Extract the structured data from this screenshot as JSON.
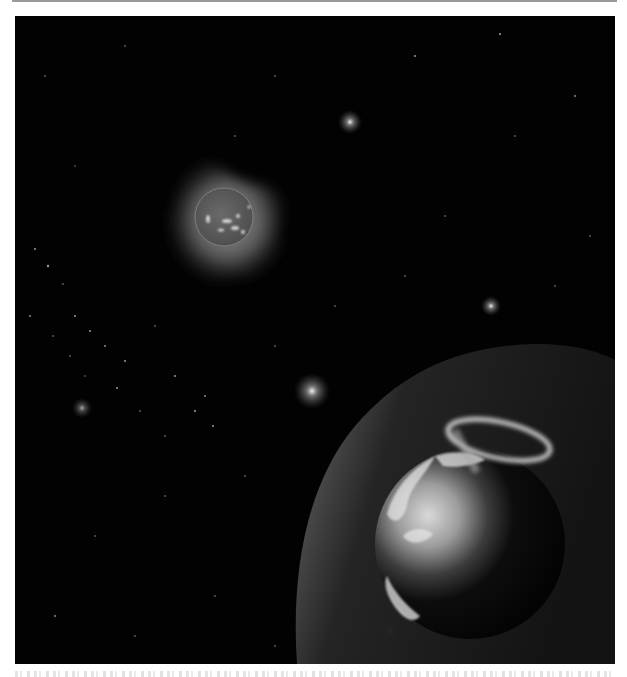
{
  "figure": {
    "background_color": "#020202",
    "elements": {
      "sun": {
        "cx": 209,
        "cy": 201,
        "corona_color": "#8a8a8a",
        "disk_color": "#5c5c5c"
      },
      "earth": {
        "cx": 455,
        "cy": 528,
        "r": 95
      },
      "magnetosphere": {
        "edge_x": 282,
        "top_y": 330
      },
      "aurora_oval": {
        "cx": 484,
        "cy": 424,
        "rx": 52,
        "ry": 20
      },
      "bright_stars": [
        {
          "x": 335,
          "y": 106
        },
        {
          "x": 297,
          "y": 375
        },
        {
          "x": 476,
          "y": 290
        },
        {
          "x": 67,
          "y": 392
        }
      ]
    }
  },
  "caption": {
    "visible": "clipped",
    "text": ""
  }
}
